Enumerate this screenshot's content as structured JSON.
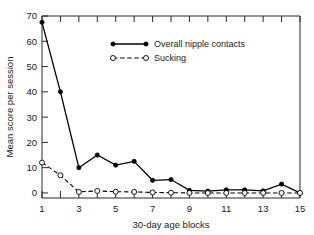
{
  "chart_data": {
    "type": "line",
    "title": "",
    "xlabel": "30-day age blocks",
    "ylabel": "Mean score per session",
    "x": [
      1,
      2,
      3,
      4,
      5,
      6,
      7,
      8,
      9,
      10,
      11,
      12,
      13,
      14,
      15
    ],
    "xlim": [
      1,
      15
    ],
    "ylim": [
      -2,
      70
    ],
    "grid": false,
    "legend_position": "upper-center",
    "x_tick_labels": [
      "1",
      "3",
      "5",
      "7",
      "9",
      "11",
      "13",
      "15"
    ],
    "x_tick_values": [
      1,
      3,
      5,
      7,
      9,
      11,
      13,
      15
    ],
    "x_minor_tick_values": [
      2,
      4,
      6,
      8,
      10,
      12,
      14
    ],
    "y_tick_labels": [
      "0",
      "10",
      "20",
      "30",
      "40",
      "50",
      "60",
      "70"
    ],
    "y_tick_values": [
      0,
      10,
      20,
      30,
      40,
      50,
      60,
      70
    ],
    "series": [
      {
        "name": "Overall nipple contacts",
        "marker": "filled-circle",
        "linestyle": "solid",
        "color": "#000000",
        "values": [
          67.5,
          40,
          10,
          15,
          11,
          12.5,
          5,
          5.3,
          1,
          0.7,
          1.2,
          1.2,
          0.8,
          3.5,
          0
        ]
      },
      {
        "name": "Sucking",
        "marker": "open-circle",
        "linestyle": "dashed",
        "color": "#000000",
        "values": [
          12,
          7,
          0.4,
          0.8,
          0.5,
          0.4,
          0.2,
          0.1,
          0,
          0,
          0,
          0,
          0,
          0,
          0
        ]
      }
    ]
  },
  "legend": {
    "entries": [
      {
        "label": "Overall nipple contacts"
      },
      {
        "label": "Sucking"
      }
    ]
  }
}
